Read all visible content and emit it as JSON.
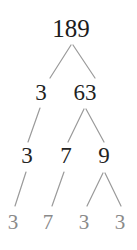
{
  "diagram": {
    "type": "factor-tree",
    "background_color": "#ffffff",
    "node_color_dark": "#1c1c1c",
    "node_color_leaf": "#8a8a8a",
    "edge_color": "#9a9a9a",
    "levels": [
      {
        "index": 0,
        "nodes": [
          {
            "label": "189",
            "x": 71,
            "y": 28,
            "style": "lvl0",
            "leaf": false
          }
        ]
      },
      {
        "index": 1,
        "nodes": [
          {
            "label": "3",
            "x": 41,
            "y": 92,
            "style": "lvl1",
            "leaf": true
          },
          {
            "label": "63",
            "x": 85,
            "y": 92,
            "style": "lvl1",
            "leaf": false
          }
        ]
      },
      {
        "index": 2,
        "nodes": [
          {
            "label": "3",
            "x": 27,
            "y": 155,
            "style": "lvl2",
            "leaf": true
          },
          {
            "label": "7",
            "x": 66,
            "y": 155,
            "style": "lvl2",
            "leaf": true
          },
          {
            "label": "9",
            "x": 104,
            "y": 155,
            "style": "lvl2",
            "leaf": false
          }
        ]
      },
      {
        "index": 3,
        "nodes": [
          {
            "label": "3",
            "x": 13,
            "y": 222,
            "style": "lvl3",
            "leaf": true
          },
          {
            "label": "7",
            "x": 48,
            "y": 222,
            "style": "lvl3",
            "leaf": true
          },
          {
            "label": "3",
            "x": 84,
            "y": 222,
            "style": "lvl3",
            "leaf": true
          },
          {
            "label": "3",
            "x": 120,
            "y": 222,
            "style": "lvl3",
            "leaf": true
          }
        ]
      }
    ],
    "edges": [
      {
        "name": "edge-189-to-3",
        "x1": 71,
        "y1": 45,
        "x2": 50,
        "y2": 78
      },
      {
        "name": "edge-189-to-63",
        "x1": 73,
        "y1": 45,
        "x2": 95,
        "y2": 78
      },
      {
        "name": "edge-3-to-3",
        "x1": 40,
        "y1": 108,
        "x2": 28,
        "y2": 142
      },
      {
        "name": "edge-63-to-7",
        "x1": 84,
        "y1": 109,
        "x2": 68,
        "y2": 142
      },
      {
        "name": "edge-63-to-9",
        "x1": 86,
        "y1": 109,
        "x2": 104,
        "y2": 142
      },
      {
        "name": "edge-3-to-3-leaf",
        "x1": 26,
        "y1": 172,
        "x2": 15,
        "y2": 206
      },
      {
        "name": "edge-7-to-7-leaf",
        "x1": 64,
        "y1": 172,
        "x2": 52,
        "y2": 206
      },
      {
        "name": "edge-9-to-3-left",
        "x1": 103,
        "y1": 173,
        "x2": 87,
        "y2": 206
      },
      {
        "name": "edge-9-to-3-right",
        "x1": 105,
        "y1": 173,
        "x2": 121,
        "y2": 206
      }
    ]
  }
}
